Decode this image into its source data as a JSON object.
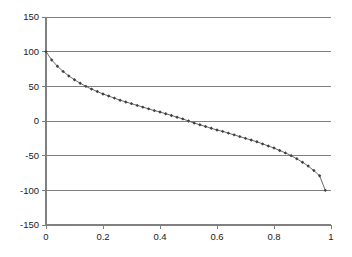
{
  "chart_data": {
    "type": "line",
    "title": "",
    "subtitle": "",
    "xlabel": "",
    "ylabel": "",
    "xlim": [
      0,
      1
    ],
    "ylim": [
      -150,
      150
    ],
    "grid": true,
    "grid_axis": "y",
    "legend": false,
    "legend_position": "none",
    "marker": "diamond",
    "marker_color": "#404040",
    "line_color": "#5a5a5a",
    "x_ticks": [
      0,
      0.2,
      0.4,
      0.6,
      0.8,
      1
    ],
    "x_tick_labels": [
      "0",
      "0.2",
      "0.4",
      "0.6",
      "0.8",
      "1"
    ],
    "y_ticks": [
      150,
      100,
      50,
      0,
      -50,
      -100,
      -150
    ],
    "y_tick_labels": [
      "150",
      "100",
      "50",
      "0",
      "-50",
      "-100",
      "-150"
    ],
    "series": [
      {
        "name": "series-1",
        "x": [
          0.0,
          0.02,
          0.04,
          0.06,
          0.08,
          0.1,
          0.12,
          0.14,
          0.16,
          0.18,
          0.2,
          0.22,
          0.24,
          0.26,
          0.28,
          0.3,
          0.32,
          0.34,
          0.36,
          0.38,
          0.4,
          0.42,
          0.44,
          0.46,
          0.48,
          0.5,
          0.52,
          0.54,
          0.56,
          0.58,
          0.6,
          0.62,
          0.64,
          0.66,
          0.68,
          0.7,
          0.72,
          0.74,
          0.76,
          0.78,
          0.8,
          0.82,
          0.84,
          0.86,
          0.88,
          0.9,
          0.92,
          0.94,
          0.96,
          0.98
        ],
        "y": [
          100.0,
          88.0,
          79.0,
          71.5,
          65.0,
          59.5,
          54.5,
          50.0,
          46.0,
          42.5,
          39.0,
          36.0,
          33.0,
          30.0,
          27.5,
          25.0,
          22.5,
          20.0,
          17.5,
          15.0,
          13.0,
          10.5,
          8.0,
          5.5,
          3.0,
          0.0,
          -3.0,
          -5.5,
          -8.0,
          -10.5,
          -13.0,
          -15.0,
          -17.5,
          -20.0,
          -22.5,
          -25.0,
          -27.5,
          -30.0,
          -33.0,
          -36.0,
          -39.0,
          -42.5,
          -46.0,
          -50.0,
          -54.5,
          -59.5,
          -65.0,
          -71.5,
          -79.0,
          -100.0
        ]
      }
    ]
  },
  "plot_area": {
    "left": 46,
    "right": 331,
    "top": 17,
    "bottom": 225
  }
}
